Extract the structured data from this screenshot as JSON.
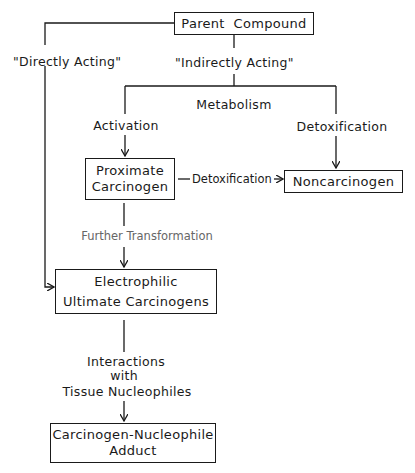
{
  "diagram": {
    "nodes": {
      "parent": "Parent  Compound",
      "proximate_line1": "Proximate",
      "proximate_line2": "Carcinogen",
      "noncarcinogen": "Noncarcinogen",
      "electrophilic_line1": "Electrophilic",
      "electrophilic_line2": "Ultimate Carcinogens",
      "adduct_line1": "Carcinogen-Nucleophile",
      "adduct_line2": "Adduct"
    },
    "labels": {
      "directly_acting": "\"Directly Acting\"",
      "indirectly_acting": "\"Indirectly Acting\"",
      "metabolism": "Metabolism",
      "activation": "Activation",
      "detoxification_right": "Detoxification",
      "detoxification_mid": "Detoxification",
      "further_transformation": "Further Transformation",
      "interactions_line1": "Interactions",
      "interactions_line2": "with",
      "interactions_line3": "Tissue Nucleophiles"
    },
    "edges": [
      {
        "from": "Parent Compound",
        "to": "Electrophilic Ultimate Carcinogens",
        "label": "\"Directly Acting\""
      },
      {
        "from": "Parent Compound",
        "to": "Metabolism branch",
        "label": "\"Indirectly Acting\""
      },
      {
        "from": "Metabolism branch",
        "to": "Proximate Carcinogen",
        "label": "Activation"
      },
      {
        "from": "Metabolism branch",
        "to": "Noncarcinogen",
        "label": "Detoxification"
      },
      {
        "from": "Proximate Carcinogen",
        "to": "Noncarcinogen",
        "label": "Detoxification"
      },
      {
        "from": "Proximate Carcinogen",
        "to": "Electrophilic Ultimate Carcinogens",
        "label": "Further Transformation"
      },
      {
        "from": "Electrophilic Ultimate Carcinogens",
        "to": "Carcinogen-Nucleophile Adduct",
        "label": "Interactions with Tissue Nucleophiles"
      }
    ]
  }
}
